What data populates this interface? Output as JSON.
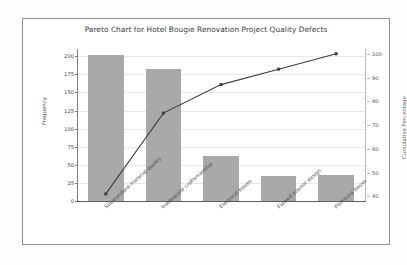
{
  "figure": {
    "title": "Pareto Chart for Hotel Bougie Renovation Project Quality Defects",
    "bar_color": "#a9a9a9",
    "line_color": "#3d3d3d",
    "frame_color": "#8e8e8e",
    "background": "#ffffff"
  },
  "chart_data": {
    "type": "bar",
    "title": "Pareto Chart for Hotel Bougie Renovation Project Quality Defects",
    "xlabel": "",
    "ylabel": "Frequency",
    "y2label": "Cumulative Percentage",
    "categories": [
      "Substandard material quality",
      "Inadequate craftsmanship",
      "Electrical Issues",
      "Flawed interior design",
      "Plumbing Issues"
    ],
    "series": [
      {
        "name": "Frequency",
        "type": "bar",
        "axis": "left",
        "values": [
          202,
          182,
          62,
          34,
          36
        ]
      },
      {
        "name": "Cumulative Percentage",
        "type": "line",
        "axis": "right",
        "values": [
          41,
          75,
          87,
          93.5,
          100
        ]
      }
    ],
    "ylim": [
      0,
      210
    ],
    "y2lim": [
      38,
      102
    ],
    "yticks": [
      0,
      25,
      50,
      75,
      100,
      125,
      150,
      175,
      200
    ],
    "y2ticks": [
      40,
      50,
      60,
      70,
      80,
      90,
      100
    ],
    "grid": true,
    "legend": "none"
  },
  "axes": {
    "left": {
      "label": "Frequency",
      "ticks": [
        "0",
        "25",
        "50",
        "75",
        "100",
        "125",
        "150",
        "175",
        "200"
      ]
    },
    "right": {
      "label": "Cumulative Percentage",
      "ticks": [
        "40",
        "50",
        "60",
        "70",
        "80",
        "90",
        "100"
      ]
    }
  }
}
